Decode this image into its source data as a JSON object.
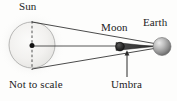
{
  "diagram": {
    "note": "Not to scale",
    "labels": {
      "sun": "Sun",
      "moon": "Moon",
      "earth": "Earth",
      "umbra": "Umbra",
      "not_to_scale": "Not to scale"
    },
    "colors": {
      "background": "#fdfdfc",
      "line": "#2b2b2b",
      "sun_fill": "#f2f1ef",
      "sun_edge": "#9b9b99",
      "sun_glow": "#d9d9d7",
      "moon_fill": "#2a2a2a",
      "moon_edge": "#111111",
      "earth_light": "#e2e2e2",
      "earth_dark": "#6e6e6e",
      "umbra_fill": "#3a3a3a",
      "text": "#1c1c1c"
    },
    "bodies": [
      {
        "name": "sun",
        "cx": 32,
        "cy": 45,
        "r": 23
      },
      {
        "name": "moon",
        "cx": 120,
        "cy": 47,
        "r": 4.2
      },
      {
        "name": "earth",
        "cx": 162,
        "cy": 47,
        "r": 9
      }
    ],
    "geometry": {
      "axis": {
        "x1": 32,
        "y1": 46,
        "x2": 168,
        "y2": 46
      },
      "sun_dashed_diameter": {
        "x": 32,
        "y1": 21,
        "y2": 70
      },
      "tangent_upper": {
        "x1": 32,
        "y1": 22,
        "x2": 163,
        "y2": 45
      },
      "tangent_lower": {
        "x1": 32,
        "y1": 69,
        "x2": 163,
        "y2": 47
      },
      "umbra_cone": {
        "apex_x": 154,
        "apex_y": 46.5,
        "base_x": 116,
        "base_top_y": 43,
        "base_bottom_y": 51
      },
      "umbra_leader": {
        "x": 127,
        "y1": 53,
        "y2": 78
      }
    }
  }
}
